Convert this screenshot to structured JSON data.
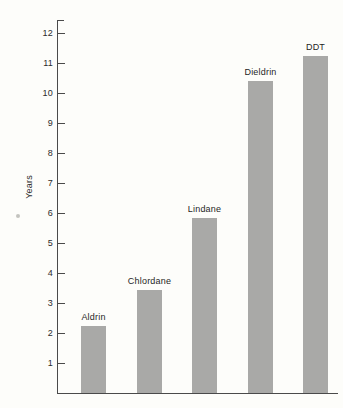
{
  "chart_data": {
    "type": "bar",
    "title": "",
    "xlabel": "",
    "ylabel": "Years",
    "categories": [
      "Aldrin",
      "Chlordane",
      "Lindane",
      "Dieldrin",
      "DDT"
    ],
    "values": [
      2.25,
      3.45,
      5.85,
      10.4,
      11.25
    ],
    "ylim": [
      0,
      12
    ],
    "yticks": [
      1,
      2,
      3,
      4,
      5,
      6,
      7,
      8,
      9,
      10,
      11,
      12
    ],
    "ytick_labels": [
      "1",
      "2",
      "3",
      "4",
      "5",
      "6",
      "7",
      "8",
      "9",
      "10",
      "11",
      "12"
    ],
    "grid": false,
    "legend": null,
    "bar_color": "#a9a9a7",
    "axis_color": "#4a4a4a",
    "text_color": "#1f1f1f",
    "background_color": "#fdfdfa",
    "data_labels": [
      {
        "category": "Aldrin",
        "label": "Aldrin",
        "value": 2.25
      },
      {
        "category": "Chlordane",
        "label": "Chlordane",
        "value": 3.45
      },
      {
        "category": "Lindane",
        "label": "Lindane",
        "value": 5.85
      },
      {
        "category": "Dieldrin",
        "label": "Dieldrin",
        "value": 10.4
      },
      {
        "category": "DDT",
        "label": "DDT",
        "value": 11.25
      }
    ]
  }
}
